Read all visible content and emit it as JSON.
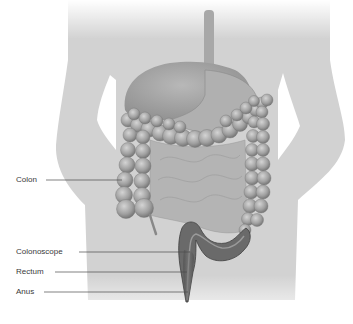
{
  "diagram": {
    "colors": {
      "background": "#ffffff",
      "silhouette": "#d2d2d2",
      "organs": "#a9a9a9",
      "organs_dark": "#8e8e8e",
      "colon": "#9c9c9c",
      "colon_highlight": "#c4c4c4",
      "rectum": "#5a5a5a",
      "label_text": "#3a3a3a",
      "leader_line": "#4a4a4a"
    },
    "labels": [
      {
        "id": "colon",
        "text": "Colon",
        "x": 16,
        "y": 175,
        "line_x1": 46,
        "line_x2": 122,
        "line_y": 180
      },
      {
        "id": "colonoscope",
        "text": "Colonoscope",
        "x": 16,
        "y": 247,
        "line_x1": 79,
        "line_x2": 190,
        "line_y": 252
      },
      {
        "id": "rectum",
        "text": "Rectum",
        "x": 16,
        "y": 267,
        "line_x1": 55,
        "line_x2": 187,
        "line_y": 272
      },
      {
        "id": "anus",
        "text": "Anus",
        "x": 16,
        "y": 287,
        "line_x1": 44,
        "line_x2": 188,
        "line_y": 292
      }
    ]
  }
}
